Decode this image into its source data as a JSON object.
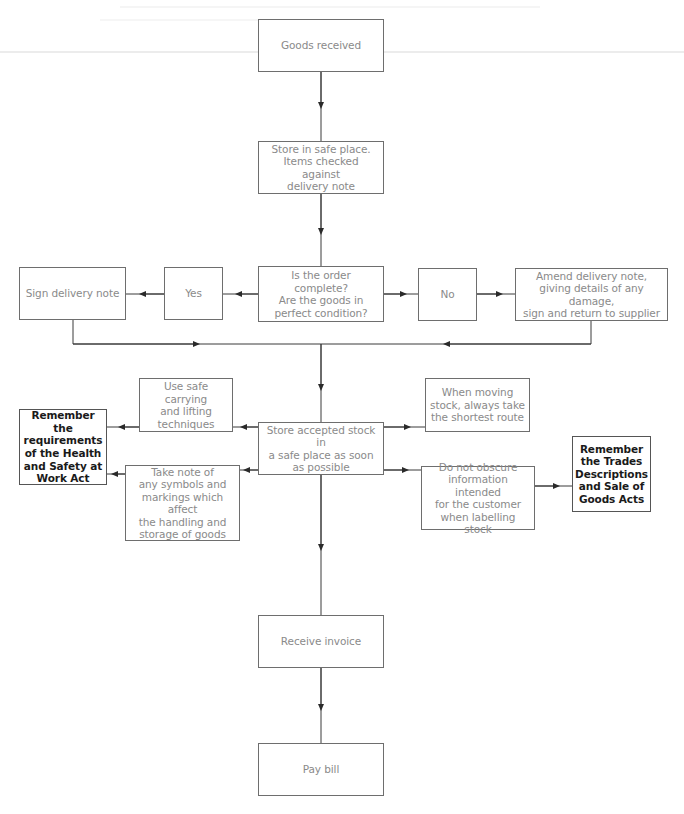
{
  "diagram": {
    "type": "flowchart",
    "colors": {
      "line": "#3a3a3a",
      "box_border": "#6e6e6e",
      "text_regular": "#8a8a8a",
      "text_bold": "#1a1a1a",
      "background": "#ffffff"
    },
    "nodes": {
      "goods_received": "Goods received",
      "store_safe": "Store in safe place.\nItems checked against\ndelivery note",
      "question": "Is the order complete?\nAre the goods in\nperfect condition?",
      "yes": "Yes",
      "no": "No",
      "sign_note": "Sign delivery note",
      "amend_note": "Amend delivery note,\ngiving details of any damage,\nsign and return to supplier",
      "store_accepted": "Store accepted stock in\na safe place as soon\nas possible",
      "safe_carrying": "Use safe carrying\nand lifting\ntechniques",
      "take_note": "Take note of\nany symbols and\nmarkings which affect\nthe handling and\nstorage of goods",
      "health_safety": "Remember the\nrequirements\nof the Health\nand Safety at\nWork Act",
      "shortest_route": "When moving\nstock, always take\nthe shortest route",
      "do_not_obscure": "Do not obscure\ninformation intended\nfor the customer\nwhen labelling stock",
      "trades_descriptions": "Remember\nthe Trades\nDescriptions\nand Sale of\nGoods Acts",
      "receive_invoice": "Receive invoice",
      "pay_bill": "Pay bill"
    },
    "edges": [
      {
        "from": "goods_received",
        "to": "store_safe"
      },
      {
        "from": "store_safe",
        "to": "question"
      },
      {
        "from": "question",
        "to": "yes"
      },
      {
        "from": "yes",
        "to": "sign_note"
      },
      {
        "from": "question",
        "to": "no"
      },
      {
        "from": "no",
        "to": "amend_note"
      },
      {
        "from": "sign_note",
        "to": "store_accepted"
      },
      {
        "from": "amend_note",
        "to": "store_accepted"
      },
      {
        "from": "store_accepted",
        "to": "safe_carrying"
      },
      {
        "from": "safe_carrying",
        "to": "health_safety"
      },
      {
        "from": "store_accepted",
        "to": "take_note"
      },
      {
        "from": "take_note",
        "to": "health_safety"
      },
      {
        "from": "store_accepted",
        "to": "shortest_route"
      },
      {
        "from": "store_accepted",
        "to": "do_not_obscure"
      },
      {
        "from": "do_not_obscure",
        "to": "trades_descriptions"
      },
      {
        "from": "store_accepted",
        "to": "receive_invoice"
      },
      {
        "from": "receive_invoice",
        "to": "pay_bill"
      }
    ]
  }
}
